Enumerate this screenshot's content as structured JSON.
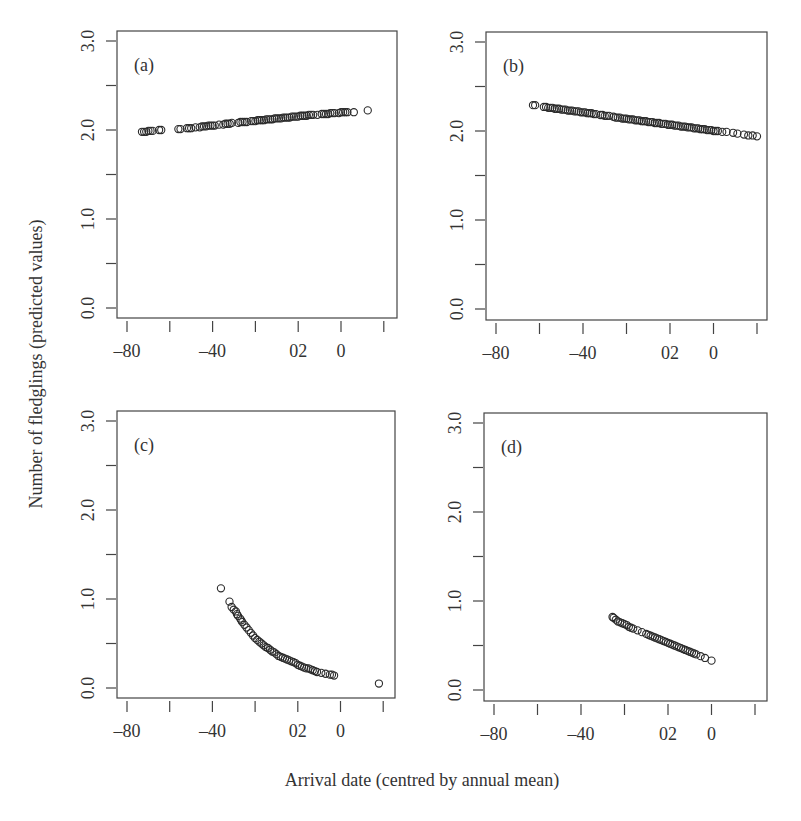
{
  "figure": {
    "ylabel": "Number of fledglings (predicted values)",
    "xlabel": "Arrival date (centred by annual mean)",
    "colors": {
      "axis": "#444444",
      "marker": "#2a2a2a",
      "text": "#333333",
      "background": "#ffffff"
    }
  },
  "chart_data": [
    {
      "type": "scatter",
      "panel": "(a)",
      "title": "(a)",
      "xlabel": "Arrival date (centred by annual mean)",
      "ylabel": "Number of fledglings (predicted values)",
      "xticks": [
        -80,
        -60,
        -40,
        -20,
        0,
        20,
        40
      ],
      "xtick_labels": [
        "-80",
        "",
        "-40",
        "",
        "02",
        "0",
        ""
      ],
      "yticks": [
        0.0,
        0.5,
        1.0,
        1.5,
        2.0,
        2.5,
        3.0
      ],
      "ytick_labels": [
        "0.0",
        "",
        "1.0",
        "",
        "2.0",
        "",
        "3.0"
      ],
      "xlim": [
        -84.7,
        45.8
      ],
      "ylim": [
        -0.11,
        3.12
      ],
      "grid": false,
      "points": [
        {
          "x": -73,
          "y": 1.98
        },
        {
          "x": -72,
          "y": 1.98
        },
        {
          "x": -71,
          "y": 1.98
        },
        {
          "x": -70,
          "y": 1.99
        },
        {
          "x": -69,
          "y": 1.99
        },
        {
          "x": -68,
          "y": 1.99
        },
        {
          "x": -65,
          "y": 2.0
        },
        {
          "x": -64,
          "y": 2.0
        },
        {
          "x": -56,
          "y": 2.01
        },
        {
          "x": -55,
          "y": 2.01
        },
        {
          "x": -52,
          "y": 2.02
        },
        {
          "x": -51,
          "y": 2.02
        },
        {
          "x": -50,
          "y": 2.02
        },
        {
          "x": -48,
          "y": 2.03
        },
        {
          "x": -46,
          "y": 2.03
        },
        {
          "x": -45,
          "y": 2.04
        },
        {
          "x": -44,
          "y": 2.04
        },
        {
          "x": -43,
          "y": 2.04
        },
        {
          "x": -42,
          "y": 2.05
        },
        {
          "x": -41,
          "y": 2.05
        },
        {
          "x": -40,
          "y": 2.05
        },
        {
          "x": -39,
          "y": 2.05
        },
        {
          "x": -37,
          "y": 2.06
        },
        {
          "x": -35,
          "y": 2.06
        },
        {
          "x": -34,
          "y": 2.07
        },
        {
          "x": -33,
          "y": 2.07
        },
        {
          "x": -32,
          "y": 2.07
        },
        {
          "x": -31,
          "y": 2.08
        },
        {
          "x": -28,
          "y": 2.08
        },
        {
          "x": -27,
          "y": 2.09
        },
        {
          "x": -26,
          "y": 2.09
        },
        {
          "x": -25,
          "y": 2.09
        },
        {
          "x": -24,
          "y": 2.09
        },
        {
          "x": -22,
          "y": 2.1
        },
        {
          "x": -21,
          "y": 2.1
        },
        {
          "x": -20,
          "y": 2.1
        },
        {
          "x": -19,
          "y": 2.11
        },
        {
          "x": -18,
          "y": 2.11
        },
        {
          "x": -17,
          "y": 2.11
        },
        {
          "x": -16,
          "y": 2.11
        },
        {
          "x": -15,
          "y": 2.12
        },
        {
          "x": -14,
          "y": 2.12
        },
        {
          "x": -13,
          "y": 2.12
        },
        {
          "x": -12,
          "y": 2.12
        },
        {
          "x": -11,
          "y": 2.13
        },
        {
          "x": -10,
          "y": 2.13
        },
        {
          "x": -9,
          "y": 2.13
        },
        {
          "x": -8,
          "y": 2.13
        },
        {
          "x": -7,
          "y": 2.14
        },
        {
          "x": -6,
          "y": 2.14
        },
        {
          "x": -5,
          "y": 2.14
        },
        {
          "x": -4,
          "y": 2.14
        },
        {
          "x": -3,
          "y": 2.15
        },
        {
          "x": -2,
          "y": 2.15
        },
        {
          "x": -1,
          "y": 2.15
        },
        {
          "x": 0,
          "y": 2.15
        },
        {
          "x": 1,
          "y": 2.16
        },
        {
          "x": 2,
          "y": 2.16
        },
        {
          "x": 3,
          "y": 2.16
        },
        {
          "x": 4,
          "y": 2.16
        },
        {
          "x": 5,
          "y": 2.17
        },
        {
          "x": 6,
          "y": 2.17
        },
        {
          "x": 7,
          "y": 2.17
        },
        {
          "x": 9,
          "y": 2.17
        },
        {
          "x": 11,
          "y": 2.18
        },
        {
          "x": 12,
          "y": 2.18
        },
        {
          "x": 13,
          "y": 2.18
        },
        {
          "x": 14,
          "y": 2.18
        },
        {
          "x": 15,
          "y": 2.19
        },
        {
          "x": 16,
          "y": 2.19
        },
        {
          "x": 17,
          "y": 2.19
        },
        {
          "x": 19,
          "y": 2.19
        },
        {
          "x": 20,
          "y": 2.2
        },
        {
          "x": 21,
          "y": 2.2
        },
        {
          "x": 22,
          "y": 2.2
        },
        {
          "x": 23,
          "y": 2.2
        },
        {
          "x": 26,
          "y": 2.2
        },
        {
          "x": 32.5,
          "y": 2.22
        }
      ]
    },
    {
      "type": "scatter",
      "panel": "(b)",
      "title": "(b)",
      "xlabel": "Arrival date (centred by annual mean)",
      "ylabel": "Number of fledglings (predicted values)",
      "xticks": [
        -80,
        -60,
        -40,
        -20,
        0,
        20,
        40
      ],
      "xtick_labels": [
        "-80",
        "",
        "-40",
        "",
        "02",
        "0",
        ""
      ],
      "yticks": [
        0.0,
        0.5,
        1.0,
        1.5,
        2.0,
        2.5,
        3.0
      ],
      "ytick_labels": [
        "0.0",
        "",
        "1.0",
        "",
        "2.0",
        "",
        "3.0"
      ],
      "xlim": [
        -84.6,
        45.0
      ],
      "ylim": [
        -0.13,
        3.1
      ],
      "grid": false,
      "points": [
        {
          "x": -63,
          "y": 2.29
        },
        {
          "x": -62,
          "y": 2.29
        },
        {
          "x": -58,
          "y": 2.27
        },
        {
          "x": -57,
          "y": 2.27
        },
        {
          "x": -56,
          "y": 2.26
        },
        {
          "x": -55,
          "y": 2.26
        },
        {
          "x": -54,
          "y": 2.26
        },
        {
          "x": -53,
          "y": 2.25
        },
        {
          "x": -52,
          "y": 2.25
        },
        {
          "x": -51,
          "y": 2.25
        },
        {
          "x": -50,
          "y": 2.24
        },
        {
          "x": -49,
          "y": 2.24
        },
        {
          "x": -48,
          "y": 2.24
        },
        {
          "x": -47,
          "y": 2.23
        },
        {
          "x": -46,
          "y": 2.23
        },
        {
          "x": -45,
          "y": 2.23
        },
        {
          "x": -44,
          "y": 2.22
        },
        {
          "x": -43,
          "y": 2.22
        },
        {
          "x": -42,
          "y": 2.22
        },
        {
          "x": -41,
          "y": 2.21
        },
        {
          "x": -40,
          "y": 2.21
        },
        {
          "x": -39,
          "y": 2.21
        },
        {
          "x": -38,
          "y": 2.2
        },
        {
          "x": -37,
          "y": 2.2
        },
        {
          "x": -36,
          "y": 2.2
        },
        {
          "x": -35,
          "y": 2.19
        },
        {
          "x": -34,
          "y": 2.19
        },
        {
          "x": -32,
          "y": 2.18
        },
        {
          "x": -31,
          "y": 2.18
        },
        {
          "x": -30,
          "y": 2.17
        },
        {
          "x": -29,
          "y": 2.17
        },
        {
          "x": -28,
          "y": 2.17
        },
        {
          "x": -26,
          "y": 2.16
        },
        {
          "x": -25,
          "y": 2.15
        },
        {
          "x": -24,
          "y": 2.15
        },
        {
          "x": -23,
          "y": 2.15
        },
        {
          "x": -22,
          "y": 2.14
        },
        {
          "x": -21,
          "y": 2.14
        },
        {
          "x": -20,
          "y": 2.14
        },
        {
          "x": -19,
          "y": 2.13
        },
        {
          "x": -18,
          "y": 2.13
        },
        {
          "x": -17,
          "y": 2.13
        },
        {
          "x": -16,
          "y": 2.12
        },
        {
          "x": -15,
          "y": 2.12
        },
        {
          "x": -14,
          "y": 2.12
        },
        {
          "x": -13,
          "y": 2.11
        },
        {
          "x": -12,
          "y": 2.11
        },
        {
          "x": -11,
          "y": 2.11
        },
        {
          "x": -10,
          "y": 2.1
        },
        {
          "x": -9,
          "y": 2.1
        },
        {
          "x": -8,
          "y": 2.1
        },
        {
          "x": -7,
          "y": 2.09
        },
        {
          "x": -6,
          "y": 2.09
        },
        {
          "x": -5,
          "y": 2.09
        },
        {
          "x": -4,
          "y": 2.08
        },
        {
          "x": -3,
          "y": 2.08
        },
        {
          "x": -2,
          "y": 2.08
        },
        {
          "x": -1,
          "y": 2.07
        },
        {
          "x": 0,
          "y": 2.07
        },
        {
          "x": 1,
          "y": 2.07
        },
        {
          "x": 2,
          "y": 2.06
        },
        {
          "x": 3,
          "y": 2.06
        },
        {
          "x": 4,
          "y": 2.06
        },
        {
          "x": 5,
          "y": 2.05
        },
        {
          "x": 6,
          "y": 2.05
        },
        {
          "x": 7,
          "y": 2.05
        },
        {
          "x": 8,
          "y": 2.04
        },
        {
          "x": 9,
          "y": 2.04
        },
        {
          "x": 10,
          "y": 2.04
        },
        {
          "x": 11,
          "y": 2.03
        },
        {
          "x": 12,
          "y": 2.03
        },
        {
          "x": 13,
          "y": 2.03
        },
        {
          "x": 14,
          "y": 2.02
        },
        {
          "x": 15,
          "y": 2.02
        },
        {
          "x": 16,
          "y": 2.02
        },
        {
          "x": 17,
          "y": 2.01
        },
        {
          "x": 18,
          "y": 2.01
        },
        {
          "x": 19,
          "y": 2.01
        },
        {
          "x": 20,
          "y": 2.0
        },
        {
          "x": 21,
          "y": 2.0
        },
        {
          "x": 22,
          "y": 2.0
        },
        {
          "x": 24,
          "y": 1.99
        },
        {
          "x": 26,
          "y": 1.99
        },
        {
          "x": 29,
          "y": 1.98
        },
        {
          "x": 31,
          "y": 1.97
        },
        {
          "x": 34,
          "y": 1.96
        },
        {
          "x": 36,
          "y": 1.95
        },
        {
          "x": 38,
          "y": 1.95
        },
        {
          "x": 40,
          "y": 1.94
        }
      ]
    },
    {
      "type": "scatter",
      "panel": "(c)",
      "title": "(c)",
      "xlabel": "Arrival date (centred by annual mean)",
      "ylabel": "Number of fledglings (predicted values)",
      "xticks": [
        -80,
        -60,
        -40,
        -20,
        0,
        20,
        40
      ],
      "xtick_labels": [
        "-80",
        "",
        "-40",
        "",
        "02",
        "0",
        ""
      ],
      "yticks": [
        0.0,
        0.5,
        1.0,
        1.5,
        2.0,
        2.5,
        3.0
      ],
      "ytick_labels": [
        "0.0",
        "",
        "1.0",
        "",
        "2.0",
        "",
        "3.0"
      ],
      "xlim": [
        -84.7,
        45.8
      ],
      "ylim": [
        -0.11,
        3.12
      ],
      "grid": false,
      "points": [
        {
          "x": -36,
          "y": 1.12
        },
        {
          "x": -32,
          "y": 0.97
        },
        {
          "x": -31,
          "y": 0.91
        },
        {
          "x": -30,
          "y": 0.88
        },
        {
          "x": -29,
          "y": 0.86
        },
        {
          "x": -28.5,
          "y": 0.83
        },
        {
          "x": -28,
          "y": 0.81
        },
        {
          "x": -27,
          "y": 0.78
        },
        {
          "x": -26.5,
          "y": 0.76
        },
        {
          "x": -26,
          "y": 0.74
        },
        {
          "x": -25,
          "y": 0.71
        },
        {
          "x": -24,
          "y": 0.68
        },
        {
          "x": -23,
          "y": 0.65
        },
        {
          "x": -22,
          "y": 0.62
        },
        {
          "x": -21,
          "y": 0.59
        },
        {
          "x": -20,
          "y": 0.56
        },
        {
          "x": -19,
          "y": 0.54
        },
        {
          "x": -18,
          "y": 0.52
        },
        {
          "x": -17,
          "y": 0.5
        },
        {
          "x": -16,
          "y": 0.48
        },
        {
          "x": -15,
          "y": 0.46
        },
        {
          "x": -14,
          "y": 0.45
        },
        {
          "x": -13,
          "y": 0.43
        },
        {
          "x": -12,
          "y": 0.41
        },
        {
          "x": -11,
          "y": 0.4
        },
        {
          "x": -10,
          "y": 0.38
        },
        {
          "x": -9,
          "y": 0.36
        },
        {
          "x": -8,
          "y": 0.35
        },
        {
          "x": -7,
          "y": 0.34
        },
        {
          "x": -6,
          "y": 0.33
        },
        {
          "x": -5,
          "y": 0.32
        },
        {
          "x": -4,
          "y": 0.31
        },
        {
          "x": -3,
          "y": 0.3
        },
        {
          "x": -2,
          "y": 0.29
        },
        {
          "x": -1,
          "y": 0.28
        },
        {
          "x": 0,
          "y": 0.26
        },
        {
          "x": 1,
          "y": 0.25
        },
        {
          "x": 2,
          "y": 0.24
        },
        {
          "x": 3,
          "y": 0.23
        },
        {
          "x": 4,
          "y": 0.22
        },
        {
          "x": 5,
          "y": 0.22
        },
        {
          "x": 6,
          "y": 0.21
        },
        {
          "x": 7,
          "y": 0.2
        },
        {
          "x": 8,
          "y": 0.19
        },
        {
          "x": 9,
          "y": 0.18
        },
        {
          "x": 11,
          "y": 0.17
        },
        {
          "x": 13,
          "y": 0.16
        },
        {
          "x": 15,
          "y": 0.15
        },
        {
          "x": 16,
          "y": 0.15
        },
        {
          "x": 17,
          "y": 0.14
        },
        {
          "x": 38,
          "y": 0.05
        }
      ]
    },
    {
      "type": "scatter",
      "panel": "(d)",
      "title": "(d)",
      "xlabel": "Arrival date (centred by annual mean)",
      "ylabel": "Number of fledglings (predicted values)",
      "xticks": [
        -80,
        -60,
        -40,
        -20,
        0,
        20,
        40
      ],
      "xtick_labels": [
        "-80",
        "",
        "-40",
        "",
        "02",
        "0",
        ""
      ],
      "yticks": [
        0.0,
        0.5,
        1.0,
        1.5,
        2.0,
        2.5,
        3.0
      ],
      "ytick_labels": [
        "0.0",
        "",
        "1.0",
        "",
        "2.0",
        "",
        "3.0"
      ],
      "xlim": [
        -84.6,
        45.0
      ],
      "ylim": [
        -0.12,
        3.1
      ],
      "grid": false,
      "points": [
        {
          "x": -25.5,
          "y": 0.82
        },
        {
          "x": -25,
          "y": 0.81
        },
        {
          "x": -24,
          "y": 0.79
        },
        {
          "x": -23,
          "y": 0.77
        },
        {
          "x": -22,
          "y": 0.76
        },
        {
          "x": -21,
          "y": 0.75
        },
        {
          "x": -20,
          "y": 0.74
        },
        {
          "x": -19,
          "y": 0.73
        },
        {
          "x": -18,
          "y": 0.71
        },
        {
          "x": -17,
          "y": 0.7
        },
        {
          "x": -16,
          "y": 0.69
        },
        {
          "x": -14,
          "y": 0.67
        },
        {
          "x": -12,
          "y": 0.65
        },
        {
          "x": -10,
          "y": 0.63
        },
        {
          "x": -9,
          "y": 0.62
        },
        {
          "x": -8,
          "y": 0.61
        },
        {
          "x": -7,
          "y": 0.6
        },
        {
          "x": -6,
          "y": 0.59
        },
        {
          "x": -5,
          "y": 0.58
        },
        {
          "x": -4,
          "y": 0.57
        },
        {
          "x": -3,
          "y": 0.56
        },
        {
          "x": -2,
          "y": 0.55
        },
        {
          "x": -1,
          "y": 0.54
        },
        {
          "x": 0,
          "y": 0.53
        },
        {
          "x": 1,
          "y": 0.52
        },
        {
          "x": 2,
          "y": 0.51
        },
        {
          "x": 3,
          "y": 0.5
        },
        {
          "x": 4,
          "y": 0.49
        },
        {
          "x": 5,
          "y": 0.48
        },
        {
          "x": 6,
          "y": 0.47
        },
        {
          "x": 7,
          "y": 0.46
        },
        {
          "x": 8,
          "y": 0.45
        },
        {
          "x": 9,
          "y": 0.44
        },
        {
          "x": 10,
          "y": 0.43
        },
        {
          "x": 11,
          "y": 0.42
        },
        {
          "x": 12,
          "y": 0.41
        },
        {
          "x": 13,
          "y": 0.4
        },
        {
          "x": 15,
          "y": 0.38
        },
        {
          "x": 17,
          "y": 0.36
        },
        {
          "x": 20,
          "y": 0.33
        }
      ]
    }
  ],
  "layout": {
    "panels": [
      {
        "left": 117,
        "top": 31,
        "right": 397,
        "bottom": 318,
        "x0px": 127,
        "xstep": 42.8,
        "y0px": 308,
        "ystep": 44.5
      },
      {
        "left": 486,
        "top": 32,
        "right": 767,
        "bottom": 320,
        "x0px": 496,
        "xstep": 43.5,
        "y0px": 309,
        "ystep": 44.5
      },
      {
        "left": 117,
        "top": 411,
        "right": 395,
        "bottom": 698,
        "x0px": 127,
        "xstep": 42.7,
        "y0px": 688,
        "ystep": 44.5
      },
      {
        "left": 484,
        "top": 413,
        "right": 767,
        "bottom": 701,
        "x0px": 494,
        "xstep": 43.5,
        "y0px": 690,
        "ystep": 44.5
      }
    ]
  }
}
